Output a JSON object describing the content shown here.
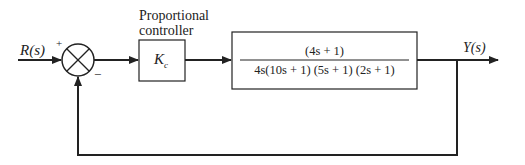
{
  "diagram": {
    "type": "block-diagram",
    "input_label": "R(s)",
    "output_label": "Y(s)",
    "summing_junction": {
      "plus_sign": "+",
      "minus_sign": "−"
    },
    "controller": {
      "caption_line1": "Proportional",
      "caption_line2": "controller",
      "gain_symbol": "K",
      "gain_subscript": "c"
    },
    "plant": {
      "numerator": "(4s + 1)",
      "denominator": "4s(10s + 1) (5s + 1) (2s + 1)"
    },
    "feedback": "unity negative feedback"
  }
}
